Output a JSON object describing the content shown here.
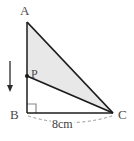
{
  "figure": {
    "kind": "geometry-diagram",
    "width": 134,
    "height": 141,
    "background_color": "#ffffff",
    "stroke_color": "#1c1c1c",
    "shade_color": "#e8e8e8",
    "dash_color": "#9a9a9a",
    "right_angle_color": "#8a8a8a",
    "vertices": [
      {
        "name": "A",
        "label": "A",
        "x": 27,
        "y": 22
      },
      {
        "name": "B",
        "label": "B",
        "x": 27,
        "y": 113
      },
      {
        "name": "C",
        "label": "C",
        "x": 113,
        "y": 113
      }
    ],
    "points": [
      {
        "name": "P",
        "label": "P",
        "x": 27,
        "y": 76,
        "marker": "dot"
      }
    ],
    "shaded_region": {
      "name": "triangle-APC",
      "polygon": "27,22 27,76 113,113",
      "fill": "#e8e8e8"
    },
    "segments": [
      {
        "name": "AB",
        "from": "A",
        "to": "B"
      },
      {
        "name": "AC",
        "from": "A",
        "to": "C"
      },
      {
        "name": "BC",
        "from": "B",
        "to": "C"
      },
      {
        "name": "PC",
        "from": "P",
        "to": "C"
      }
    ],
    "right_angle": {
      "at": "B",
      "size": 9
    },
    "arrow": {
      "name": "force-arrow",
      "direction": "down",
      "x": 10,
      "y_start": 61,
      "y_end": 91
    },
    "dimension": {
      "name": "base-length",
      "label": "8cm",
      "value": 8,
      "unit": "cm",
      "measures": "BC",
      "style": "dashed-arc"
    }
  }
}
